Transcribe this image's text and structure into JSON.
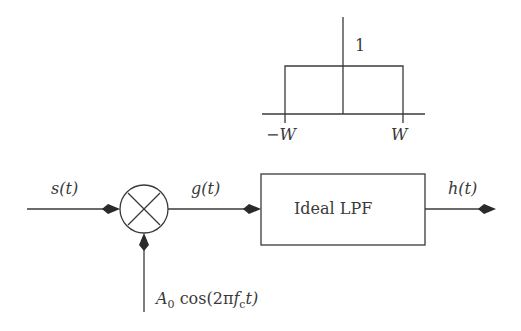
{
  "diagram": {
    "type": "block-diagram",
    "colors": {
      "stroke": "#3a3a3a",
      "background": "#ffffff"
    },
    "signals": {
      "input": "s(t)",
      "multiplier_output": "g(t)",
      "output": "h(t)",
      "carrier": {
        "amplitude": "A",
        "amplitude_sub": "0",
        "func": "cos(2π",
        "freq": "f",
        "freq_sub": "c",
        "tail": "t)"
      }
    },
    "blocks": {
      "multiplier": {
        "symbol": "×",
        "icon": "multiplier-icon"
      },
      "filter": {
        "label": "Ideal LPF"
      }
    },
    "frequency_response": {
      "height_label": "1",
      "left_cutoff": "−W",
      "right_cutoff": "W"
    }
  }
}
